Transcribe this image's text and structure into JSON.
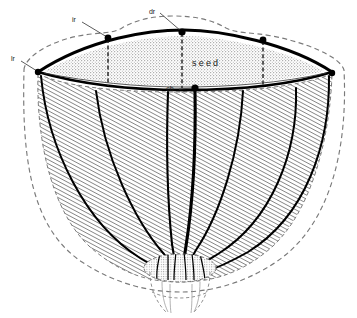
{
  "figure": {
    "background_color": "#ffffff",
    "ink_color": "#000000",
    "hatch_color": "#2b2b2b",
    "stipple_color": "#b5b5b5",
    "dashed_color": "#6e6e6e"
  },
  "labels": {
    "ir": "ir",
    "dr": "dr",
    "lr": "lr",
    "cb": "cb",
    "seed": "seed"
  },
  "annotations": [
    {
      "key": "ir",
      "text": "ir",
      "text_x": 74,
      "text_y": 20,
      "dot_x": 108,
      "dot_y": 38
    },
    {
      "key": "dr",
      "text": "dr",
      "text_x": 151,
      "text_y": 12,
      "dot_x": 182,
      "dot_y": 32
    },
    {
      "key": "lr",
      "text": "lr",
      "text_x": 12,
      "text_y": 59,
      "dot_x": 38,
      "dot_y": 72
    },
    {
      "key": "cb",
      "text": "cb",
      "text_x": 164,
      "text_y": 91,
      "dot_x": 195,
      "dot_y": 88
    }
  ],
  "seed_region": {
    "label": "seed",
    "label_x": 192,
    "label_y": 65,
    "left_vertex_x": 38,
    "right_vertex_x": 332,
    "vertex_y": 72
  },
  "vascular_bundles": {
    "count": 7,
    "description": "bundles converging downward to receptacle"
  },
  "receptacle": {
    "center_x": 180,
    "center_y": 268,
    "radius_x": 36,
    "radius_y": 14
  }
}
